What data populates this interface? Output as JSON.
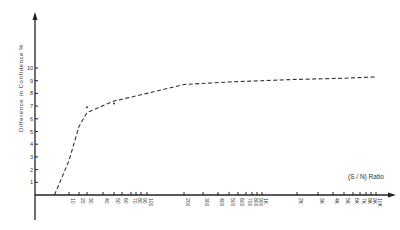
{
  "chart_data": {
    "type": "line",
    "title": "",
    "xlabel": "(S / N) Ratio",
    "ylabel": "Difference in Confidence %",
    "xscale": "log",
    "y_ticks": [
      "1",
      "2",
      "3",
      "4",
      "5",
      "6",
      "7",
      "8",
      "9",
      "10"
    ],
    "ylim": [
      0,
      10
    ],
    "x_tick_labels": [
      "10",
      "20",
      "30",
      "40",
      "50",
      "60",
      "70",
      "80",
      "90",
      "100",
      "200",
      "300",
      "400",
      "500",
      "600",
      "700",
      "800",
      "900",
      "1K",
      "2K",
      "3K",
      "4K",
      "5K",
      "6K",
      "7K",
      "8K",
      "9K",
      "10K"
    ],
    "grid": false,
    "legend": null,
    "series": [
      {
        "name": "Difference in Confidence",
        "style": "dashed",
        "x": [
          5,
          10,
          20,
          30,
          50,
          100,
          200,
          500,
          1000,
          2000,
          5000,
          10000
        ],
        "y": [
          0,
          2.7,
          5.4,
          6.5,
          7.4,
          8.0,
          8.7,
          8.9,
          9.0,
          9.1,
          9.2,
          9.3
        ]
      }
    ],
    "point_markers": [
      {
        "x": 30,
        "y": 6.9
      },
      {
        "x": 50,
        "y": 7.2
      }
    ]
  }
}
